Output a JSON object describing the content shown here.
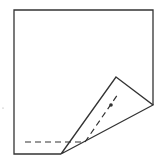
{
  "diagram": {
    "stroke_color": "#333333",
    "background": "#ffffff",
    "sheet_outline": [
      [
        14,
        10
      ],
      [
        153,
        10
      ],
      [
        153,
        105
      ],
      [
        116,
        77
      ],
      [
        61,
        154
      ],
      [
        14,
        154
      ]
    ],
    "flap_lower_edge": [
      [
        153,
        105
      ],
      [
        61,
        154
      ]
    ],
    "flap_inner_edge": [
      [
        116,
        77
      ],
      [
        61,
        154
      ]
    ],
    "dashed_horizontal": [
      [
        25,
        142
      ],
      [
        85,
        142
      ]
    ],
    "dashed_diagonal": [
      [
        85,
        142
      ],
      [
        118,
        94
      ]
    ],
    "point_marker": [
      111,
      105
    ],
    "left_mark": [
      3,
      108
    ]
  }
}
